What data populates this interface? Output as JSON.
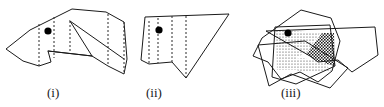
{
  "figure": {
    "name": "polygon-decomposition-overlay",
    "background_color": "#ffffff",
    "stroke_color": "#1a1a1a",
    "dashed_color": "#2b2b2b",
    "marker_color": "#000000",
    "width": 384,
    "height": 107
  },
  "captions": {
    "panel_i": "(i)",
    "panel_ii": "(ii)",
    "panel_iii": "(iii)"
  },
  "panels": [
    {
      "id": "panel-i",
      "caption": "(i)",
      "description": "First simple polygon with interior diagonal edges and vertical decomposition chords",
      "outline_points": "72,9 106,12 124,22 127,59 124,74 108,66 92,56 48,51 51,62 39,66 23,61 6,49 30,30",
      "interior_edges": [
        "70,21 92,56",
        "70,21 124,59",
        "48,51 92,56"
      ],
      "dashed_chords": [
        "39,66 39,24",
        "54,58 54,17",
        "70,21 70,53",
        "108,14 108,66",
        "124,22 124,74"
      ],
      "marker": {
        "cx": 48,
        "cy": 31,
        "r": 3.6
      }
    },
    {
      "id": "panel-ii",
      "caption": "(ii)",
      "description": "Second simple polygon with a V notch at the bottom and vertical decomposition chords",
      "outline_points": "145,17 229,14 229,15 186,78 172,62 149,64 141,60",
      "dashed_chords": [
        "149,21 149,64",
        "158,18 158,63",
        "172,16 172,62",
        "186,16 186,78"
      ],
      "marker": {
        "cx": 159,
        "cy": 30,
        "r": 3.6
      }
    },
    {
      "id": "panel-iii",
      "caption": "(iii)",
      "description": "Overlay of the two polygons rotated against each other, with shaded intersection cells",
      "polygon_a_points": "301,10 331,18 340,41 332,71 318,82 300,72 281,79 268,62 253,56 262,38",
      "polygon_b_points": "266,31 375,27 378,55 352,72 338,60 318,62 310,56",
      "polygon_c_points": "275,27 330,25 335,66 296,84 272,77",
      "polygon_d_points": "258,45 305,41 348,68 330,88 291,74 269,86",
      "shaded_cells": [
        {
          "name": "stipple-cell-upper-left",
          "fill": "stipple",
          "points": "276,30 320,33 307,52 296,58 300,70 277,70"
        },
        {
          "name": "checker-cell-right",
          "fill": "checker",
          "points": "322,33 334,33 335,66 318,62 306,54"
        },
        {
          "name": "stipple-cell-lower-band",
          "fill": "stipple",
          "points": "278,62 302,58 324,62 332,72 300,72 290,66"
        }
      ],
      "marker": {
        "cx": 288,
        "cy": 33,
        "r": 3.6
      }
    }
  ]
}
